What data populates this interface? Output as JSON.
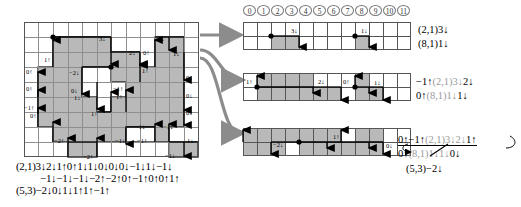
{
  "figure": {
    "type": "diagram",
    "colors": {
      "shade": "#b9b9b9",
      "gridline": "#8e8e8e",
      "outline": "#333333",
      "arrow_grey": "#9a9a9a",
      "circle_stroke": "#777777"
    }
  },
  "column_header": {
    "name": "column-index-circles",
    "labels": [
      "0",
      "1",
      "2",
      "3",
      "4",
      "5",
      "6",
      "7",
      "8",
      "9",
      "10",
      "11"
    ]
  },
  "main_grid": {
    "cols": 12,
    "rows": 9,
    "labels": [
      {
        "id": "m1",
        "text": "1↑",
        "x": 20,
        "y": 34
      },
      {
        "id": "m2",
        "text": "3↓",
        "x": 88,
        "y": 24
      },
      {
        "id": "m3",
        "text": "1↓",
        "x": 145,
        "y": 24
      },
      {
        "id": "m4",
        "text": "2↓",
        "x": 119,
        "y": 35
      },
      {
        "id": "m5",
        "text": "0↑",
        "x": 133,
        "y": 35
      },
      {
        "id": "m6",
        "text": "1↓",
        "x": 163,
        "y": 36
      },
      {
        "id": "m7",
        "text": "0↑",
        "x": 5,
        "y": 53
      },
      {
        "id": "m8",
        "text": "0↑",
        "x": 5,
        "y": 70
      },
      {
        "id": "m9",
        "text": "1↑",
        "x": 130,
        "y": 51
      },
      {
        "id": "m10",
        "text": "−2↓",
        "x": 58,
        "y": 58
      },
      {
        "id": "m11",
        "text": "0↓",
        "x": 60,
        "y": 75
      },
      {
        "id": "m12",
        "text": "1↓",
        "x": 62,
        "y": 82
      },
      {
        "id": "m13",
        "text": "−1↑",
        "x": 93,
        "y": 73
      },
      {
        "id": "m14",
        "text": "1↑",
        "x": 96,
        "y": 82
      },
      {
        "id": "m15",
        "text": "0↓",
        "x": 178,
        "y": 62
      },
      {
        "id": "m16",
        "text": "0↓",
        "x": 178,
        "y": 80
      },
      {
        "id": "m17",
        "text": "0↓",
        "x": 178,
        "y": 97
      },
      {
        "id": "m18",
        "text": "−1↑",
        "x": 9,
        "y": 93
      },
      {
        "id": "m19",
        "text": "0↑",
        "x": 15,
        "y": 101
      },
      {
        "id": "m20",
        "text": "1↑",
        "x": 76,
        "y": 102
      },
      {
        "id": "m21",
        "text": "−2↑",
        "x": 36,
        "y": 124
      },
      {
        "id": "m22",
        "text": "−2↑",
        "x": 78,
        "y": 147
      },
      {
        "id": "m23",
        "text": "−1↓",
        "x": 107,
        "y": 124
      },
      {
        "id": "m24",
        "text": "−1↓",
        "x": 132,
        "y": 110
      },
      {
        "id": "m25",
        "text": "−1↑",
        "x": 128,
        "y": 124
      },
      {
        "id": "m26",
        "text": "−1↓",
        "x": 152,
        "y": 110
      },
      {
        "id": "m27",
        "text": "1↓",
        "x": 172,
        "y": 124
      },
      {
        "id": "m28",
        "text": "−1↓",
        "x": 155,
        "y": 142
      }
    ]
  },
  "main_sequence": {
    "lines": [
      "(2,1)3↓2↓1↑0↑1↓1↓0↓0↓0↓−1↓1↓−1↓",
      "−1↓−1↓−1↓−2↑−2↑0↑−1↑0↑0↑1↑",
      "(5,3)−2↓0↓1↓1↑1↑−1↑"
    ]
  },
  "panels": [
    {
      "id": "panel-1",
      "name": "strip-panel-top",
      "labels": [
        {
          "text": "3↓",
          "x": 52,
          "y": 8
        },
        {
          "text": "1↓",
          "x": 127,
          "y": 8
        }
      ],
      "annotations": [
        {
          "text": "(2,1)3↓",
          "grey": false
        },
        {
          "text": "(8,1)1↓",
          "grey": false
        }
      ]
    },
    {
      "id": "panel-2",
      "name": "strip-panel-middle",
      "labels": [
        {
          "text": "1↑",
          "x": 5,
          "y": 9
        },
        {
          "text": "2↓",
          "x": 79,
          "y": 9
        },
        {
          "text": "0↑",
          "x": 95,
          "y": 9
        },
        {
          "text": "1↓",
          "x": 129,
          "y": 11
        }
      ],
      "annotations": [
        {
          "prefix": "−1↑",
          "grey_mid": "(2,1)3↓",
          "suffix": "2↓"
        },
        {
          "prefix": "0↑",
          "grey_mid": "(8,1)1↓",
          "suffix": "1↓"
        }
      ]
    },
    {
      "id": "panel-3",
      "name": "strip-panel-bottom",
      "labels": [
        {
          "text": "−2↓",
          "x": 32,
          "y": 12
        },
        {
          "text": "1↑",
          "x": 92,
          "y": 8
        },
        {
          "text": "0↓",
          "x": 145,
          "y": 13
        }
      ],
      "annotations": [
        {
          "prefix": "0↑−1↑",
          "grey_mid": "(2,1)3↓2↓",
          "suffix": "1↑"
        },
        {
          "prefix": "0↑",
          "grey_mid": "(8,1)1↓1↓",
          "suffix": "0↓"
        },
        {
          "text": "(5,3)−2↓"
        }
      ]
    }
  ]
}
